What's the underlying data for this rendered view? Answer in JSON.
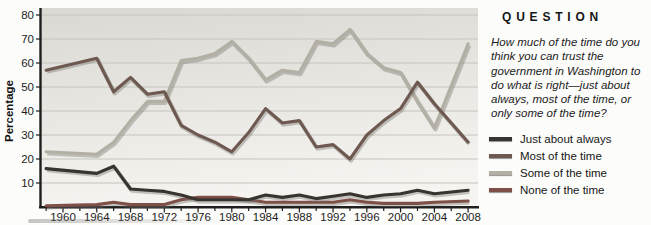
{
  "side_panel": {
    "header": "QUESTION",
    "question": "How much of the time do you think you can trust the government in Washington to do what is right—just about always, most of the time, or only some of the time?"
  },
  "chart_data": {
    "type": "line",
    "title": "",
    "xlabel": "",
    "ylabel": "Percentage",
    "ylim": [
      0,
      80
    ],
    "xlim": [
      1957,
      2009.5
    ],
    "yticks": [
      10,
      20,
      30,
      40,
      50,
      60,
      70,
      80
    ],
    "xticks": [
      1960,
      1964,
      1968,
      1972,
      1976,
      1980,
      1984,
      1988,
      1992,
      1996,
      2000,
      2004,
      2008
    ],
    "grid": true,
    "legend_position": "right",
    "x": [
      1958,
      1964,
      1966,
      1968,
      1970,
      1972,
      1974,
      1976,
      1978,
      1980,
      1982,
      1984,
      1986,
      1988,
      1990,
      1992,
      1994,
      1996,
      1998,
      2000,
      2002,
      2004,
      2008
    ],
    "series": [
      {
        "name": "Just about always",
        "color": "#38342f",
        "values": [
          16,
          14,
          17,
          7.5,
          7,
          6.5,
          5,
          3,
          3,
          3,
          3,
          5,
          4,
          5,
          3.5,
          4.5,
          5.5,
          4,
          5,
          5.5,
          7,
          5.5,
          7
        ]
      },
      {
        "name": "Most of the time",
        "color": "#6e5951",
        "values": [
          57,
          62,
          48,
          54,
          47,
          48,
          34,
          30,
          27,
          23,
          31,
          41,
          35,
          36,
          25,
          26,
          20,
          30,
          36,
          41,
          52,
          43,
          27
        ]
      },
      {
        "name": "Some of the time",
        "color": "#b4afa4",
        "values": [
          23,
          22,
          27,
          36,
          44,
          44,
          61,
          62,
          64,
          69,
          62,
          53,
          57,
          56,
          69,
          68,
          74,
          64,
          58,
          56,
          44,
          33,
          68
        ]
      },
      {
        "name": "None of the time",
        "color": "#7e5048",
        "values": [
          0.5,
          1,
          2,
          1,
          1,
          1,
          3,
          4,
          4,
          4,
          3,
          2,
          2,
          2,
          2,
          2,
          3,
          2,
          1.5,
          1.5,
          1.5,
          2,
          2.5
        ]
      }
    ],
    "colors": {
      "axis": "#1f1f1f",
      "grid": "#c6c4bd",
      "tick_text": "#1c1c1c",
      "plot_bg_top": "#d9d8d3",
      "plot_bg_bottom": "#f5f4f0"
    }
  }
}
